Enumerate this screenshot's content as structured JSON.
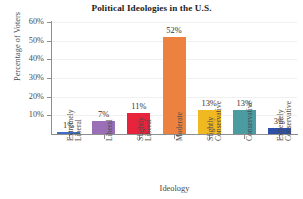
{
  "chart_data": {
    "type": "bar",
    "title": "Political Ideologies in the U.S.",
    "xlabel": "Ideology",
    "ylabel": "Percentage of Voters",
    "grid": true,
    "legend": "none",
    "ylim": [
      0,
      60
    ],
    "ytick_labels": [
      "60%",
      "50%",
      "40%",
      "30%",
      "20%",
      "10%"
    ],
    "ytick_values": [
      60,
      50,
      40,
      30,
      20,
      10
    ],
    "categories": [
      "Extremely Liberal",
      "Liberal",
      "Slightly Liberal",
      "Moderate",
      "Slightly Conservative",
      "Conservative",
      "Extremely Conservative"
    ],
    "category_lines": [
      [
        "Extremely",
        "Liberal"
      ],
      [
        "Liberal"
      ],
      [
        "Slightly",
        "Liberal"
      ],
      [
        "Moderate"
      ],
      [
        "Slightly",
        "Conservative"
      ],
      [
        "Conservative"
      ],
      [
        "Extremely",
        "Conservative"
      ]
    ],
    "values": [
      1,
      7,
      11,
      52,
      13,
      13,
      3
    ],
    "value_labels": [
      "1%",
      "7%",
      "11%",
      "52%",
      "13%",
      "13%",
      "3%"
    ],
    "bar_colors": [
      "#3E6FC4",
      "#9B6FB5",
      "#E8243C",
      "#ED8240",
      "#F0B921",
      "#4A9CA0",
      "#2E4FA8"
    ]
  }
}
